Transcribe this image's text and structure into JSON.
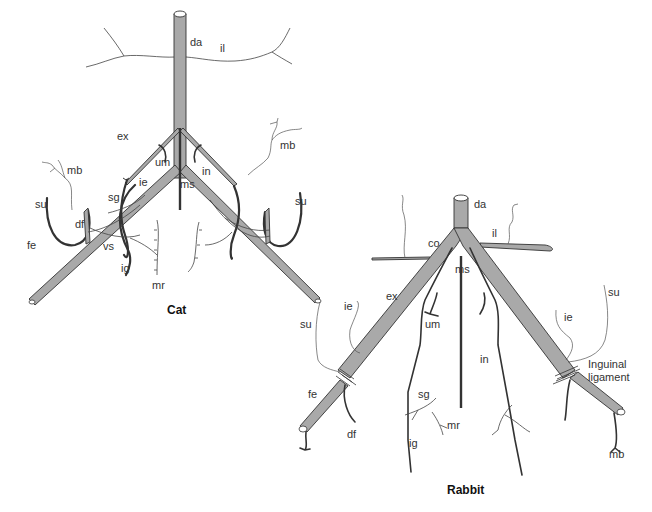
{
  "figures": [
    {
      "title": "Cat",
      "labels": {
        "da": "da",
        "il": "il",
        "ex": "ex",
        "um": "um",
        "ms": "ms",
        "in": "in",
        "mb_left": "mb",
        "mb_right": "mb",
        "su_left": "su",
        "su_right": "su",
        "sg": "sg",
        "ie": "ie",
        "df": "df",
        "fe": "fe",
        "vs": "vs",
        "ig": "ig",
        "mr": "mr"
      }
    },
    {
      "title": "Rabbit",
      "labels": {
        "da": "da",
        "co": "co",
        "il": "il",
        "ms": "ms",
        "ex": "ex",
        "um": "um",
        "in": "in",
        "su_left": "su",
        "su_right": "su",
        "ie_left": "ie",
        "ie_right": "ie",
        "fe": "fe",
        "df": "df",
        "sg": "sg",
        "mr": "mr",
        "ig": "ig",
        "mb": "mb",
        "inguinal_ligament": "Inguinal ligament",
        "inguinal_line1": "Inguinal",
        "inguinal_line2": "ligament"
      }
    }
  ]
}
